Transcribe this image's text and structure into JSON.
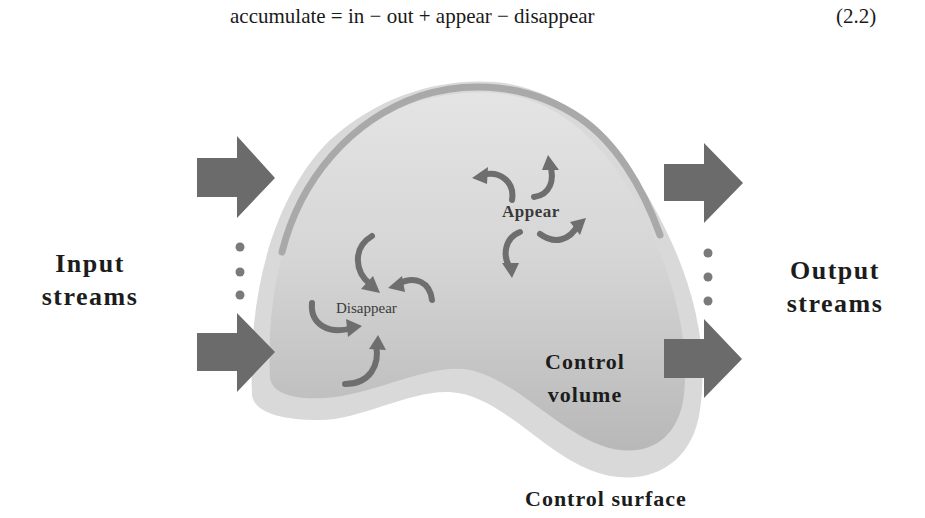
{
  "equation": {
    "text": "accumulate = in − out + appear − disappear",
    "number": "(2.2)"
  },
  "diagram": {
    "input_label_line1": "Input",
    "input_label_line2": "streams",
    "output_label_line1": "Output",
    "output_label_line2": "streams",
    "appear_label": "Appear",
    "disappear_label": "Disappear",
    "control_volume_line1": "Control",
    "control_volume_line2": "volume",
    "control_surface_label": "Control surface",
    "input_arrow_count_shown": 2,
    "output_arrow_count_shown": 2,
    "ellipsis_dots": 3
  },
  "colors": {
    "arrow": "#6b6b6b",
    "control_surface": "#d4d4d4",
    "control_volume": "#bdbdbd",
    "volume_highlight": "#e0e0e0",
    "rim": "#a9a9a9",
    "text": "#1c1c1c"
  }
}
